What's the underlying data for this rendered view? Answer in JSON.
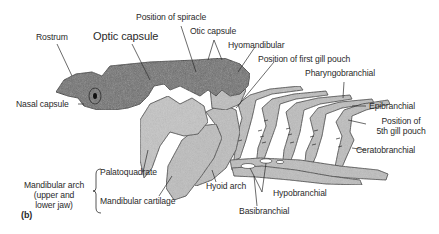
{
  "figure": {
    "panel_label": "(b)",
    "colors": {
      "neurocranium": "#6e6e6e",
      "splanchnocranium": "#bdbdbd",
      "outline": "#2b2b2b",
      "text": "#2a2a2a",
      "background": "#ffffff"
    },
    "labels": {
      "rostrum": "Rostrum",
      "optic_capsule": "Optic capsule",
      "position_of_spiracle": "Position of spiracle",
      "otic_capsule": "Otic capsule",
      "hyomandibular": "Hyomandibular",
      "position_first_gill_pouch": "Position of first gill pouch",
      "pharyngobranchial": "Pharyngobranchial",
      "epibranchial": "Epibranchial",
      "position_fifth_gill_pouch_line1": "Position of",
      "position_fifth_gill_pouch_line2": "5th gill pouch",
      "ceratobranchial": "Ceratobranchial",
      "nasal_capsule": "Nasal capsule",
      "palatoquadrate": "Palatoquadrate",
      "mandibular_cartilage": "Mandibular cartilage",
      "mandibular_arch_line1": "Mandibular arch",
      "mandibular_arch_line2": "(upper and",
      "mandibular_arch_line3": "lower jaw)",
      "hyoid_arch": "Hyoid arch",
      "hypobranchial": "Hypobranchial",
      "basibranchial": "Basibranchial"
    }
  }
}
